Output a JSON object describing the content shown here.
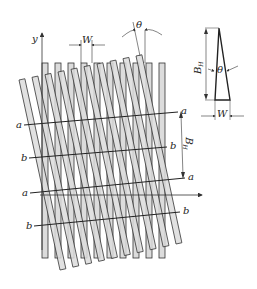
{
  "diagram": {
    "colors": {
      "strip_fill": "#dcdcdc",
      "stroke": "#333333",
      "background": "#ffffff"
    },
    "labels": {
      "y_axis": "y",
      "strip_width": "W",
      "angle": "θ",
      "fringe_spacing": "B",
      "fringe_spacing_sub": "H",
      "line_a": "a",
      "line_b": "b"
    },
    "inset": {
      "height_label": "B",
      "height_sub": "H",
      "angle_label": "θ",
      "base_label": "W"
    },
    "vertical_grating": {
      "count": 10,
      "x_start": 42,
      "pitch": 13,
      "strip_width": 6,
      "y_top": 63,
      "y_bottom": 258
    },
    "tilted_grating": {
      "count": 10,
      "top_start": [
        19,
        80
      ],
      "top_end": [
        136,
        56
      ],
      "bottom_start": [
        60,
        270
      ],
      "bottom_end": [
        176,
        244
      ],
      "strip_width": 6
    },
    "reference_lines": [
      {
        "name": "a",
        "x1": 24,
        "y1": 125,
        "x2": 178,
        "y2": 112
      },
      {
        "name": "b",
        "x1": 29,
        "y1": 158,
        "x2": 167,
        "y2": 147
      },
      {
        "name": "a",
        "x1": 30,
        "y1": 193,
        "x2": 185,
        "y2": 178
      },
      {
        "name": "b",
        "x1": 34,
        "y1": 226,
        "x2": 180,
        "y2": 212
      }
    ]
  }
}
